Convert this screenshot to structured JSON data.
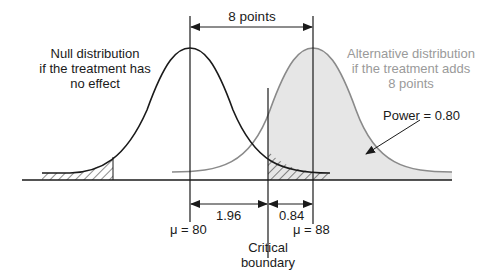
{
  "diagram": {
    "top_span_label": "8 points",
    "null_distribution": {
      "label_lines": [
        "Null distribution",
        "if the treatment has",
        "no effect"
      ],
      "mean_label": "μ = 80",
      "curve_color": "#1a1a1a"
    },
    "alternative_distribution": {
      "label_lines": [
        "Alternative distribution",
        "if the treatment adds",
        "8 points"
      ],
      "mean_label": "μ = 88",
      "curve_color": "#8a8a8a",
      "fill_color": "#e6e6e6"
    },
    "power_label": "Power = 0.80",
    "critical_boundary_lines": [
      "Critical",
      "boundary"
    ],
    "segments": {
      "left": "1.96",
      "right": "0.84"
    }
  }
}
